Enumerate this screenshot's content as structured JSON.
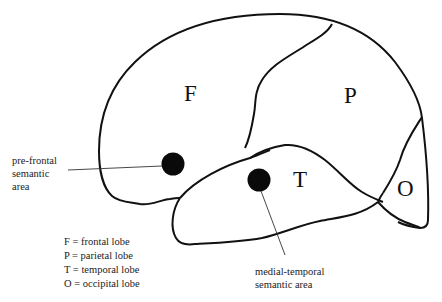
{
  "diagram": {
    "type": "brain-lateral-view",
    "lobes": {
      "frontal": "F",
      "parietal": "P",
      "temporal": "T",
      "occipital": "O"
    },
    "annotations": {
      "prefrontal": [
        "pre-frontal",
        "semantic",
        "area"
      ],
      "medial_temporal": [
        "medial-temporal",
        "semantic area"
      ]
    },
    "legend": [
      "F = frontal lobe",
      "P = parietal lobe",
      "T = temporal lobe",
      "O = occipital lobe"
    ],
    "colors": {
      "outline": "#111111",
      "marker": "#0a0a0a",
      "background": "#ffffff"
    }
  }
}
